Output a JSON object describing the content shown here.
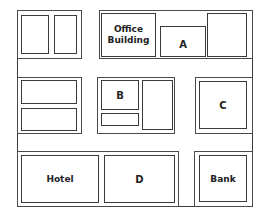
{
  "map": {
    "frame": {
      "x": 17,
      "y": 10,
      "w": 236,
      "h": 197
    },
    "line_color": "#3a3a3a",
    "blocks": [
      {
        "id": "top-left-block",
        "x": 17,
        "y": 10,
        "w": 65,
        "h": 49
      },
      {
        "id": "top-right-block",
        "x": 99,
        "y": 10,
        "w": 154,
        "h": 49
      },
      {
        "id": "mid-left-block",
        "x": 17,
        "y": 77,
        "w": 65,
        "h": 57
      },
      {
        "id": "mid-center-block",
        "x": 97,
        "y": 77,
        "w": 78,
        "h": 57
      },
      {
        "id": "mid-right-block",
        "x": 195,
        "y": 77,
        "w": 57,
        "h": 57
      },
      {
        "id": "bottom-left-block",
        "x": 17,
        "y": 151,
        "w": 162,
        "h": 56
      },
      {
        "id": "bottom-right-block",
        "x": 194,
        "y": 151,
        "w": 58,
        "h": 56
      }
    ],
    "buildings": [
      {
        "id": "building-top-left-1",
        "x": 21,
        "y": 15,
        "w": 28,
        "h": 39,
        "label": ""
      },
      {
        "id": "building-top-left-2",
        "x": 54,
        "y": 15,
        "w": 23,
        "h": 39,
        "label": ""
      },
      {
        "id": "building-office",
        "x": 101,
        "y": 13,
        "w": 55,
        "h": 44,
        "label": "Office\nBuilding"
      },
      {
        "id": "building-a",
        "x": 160,
        "y": 26,
        "w": 46,
        "h": 30,
        "label": "A",
        "low": true
      },
      {
        "id": "building-top-right",
        "x": 207,
        "y": 13,
        "w": 40,
        "h": 44,
        "label": ""
      },
      {
        "id": "building-mid-left-1",
        "x": 21,
        "y": 80,
        "w": 56,
        "h": 24,
        "label": ""
      },
      {
        "id": "building-mid-left-2",
        "x": 21,
        "y": 108,
        "w": 56,
        "h": 23,
        "label": ""
      },
      {
        "id": "building-b",
        "x": 101,
        "y": 80,
        "w": 38,
        "h": 30,
        "label": "B"
      },
      {
        "id": "building-mid-small",
        "x": 101,
        "y": 113,
        "w": 38,
        "h": 13,
        "label": ""
      },
      {
        "id": "building-mid-right-tall",
        "x": 142,
        "y": 80,
        "w": 31,
        "h": 50,
        "label": ""
      },
      {
        "id": "building-c",
        "x": 199,
        "y": 81,
        "w": 48,
        "h": 48,
        "label": "C"
      },
      {
        "id": "building-hotel",
        "x": 21,
        "y": 155,
        "w": 78,
        "h": 48,
        "label": "Hotel"
      },
      {
        "id": "building-d",
        "x": 104,
        "y": 155,
        "w": 71,
        "h": 48,
        "label": "D"
      },
      {
        "id": "building-bank",
        "x": 199,
        "y": 155,
        "w": 48,
        "h": 47,
        "label": "Bank"
      }
    ]
  }
}
